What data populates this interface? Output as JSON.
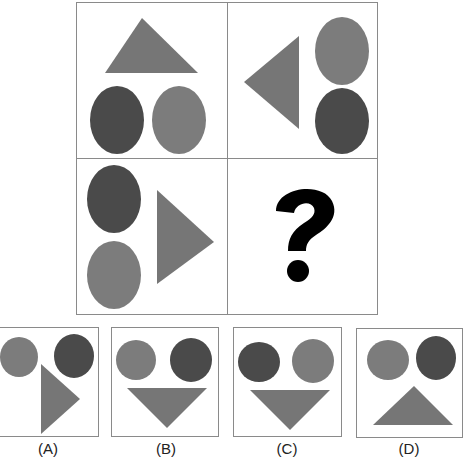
{
  "colors": {
    "light_gray": "#7c7c7c",
    "dark_gray": "#4a4a4a",
    "triangle": "#767676",
    "border": "#8a8a8a",
    "question_mark": "#000000"
  },
  "puzzle": {
    "grid": [
      {
        "id": "cell-1",
        "description": "triangle pointing up on top; dark oval bottom-left, light oval bottom-right"
      },
      {
        "id": "cell-2",
        "description": "triangle pointing left; light oval top-right, dark oval bottom-right"
      },
      {
        "id": "cell-3",
        "description": "dark oval top-left, light oval bottom-left; triangle pointing right"
      },
      {
        "id": "cell-4",
        "description": "missing",
        "symbol": "?"
      }
    ]
  },
  "options": [
    {
      "label": "(A)",
      "description": "light circle, dark circle, triangle pointing right"
    },
    {
      "label": "(B)",
      "description": "light circle, dark circle, triangle pointing down"
    },
    {
      "label": "(C)",
      "description": "dark circle, light circle, triangle pointing down"
    },
    {
      "label": "(D)",
      "description": "light circle, dark circle, triangle pointing up"
    }
  ]
}
